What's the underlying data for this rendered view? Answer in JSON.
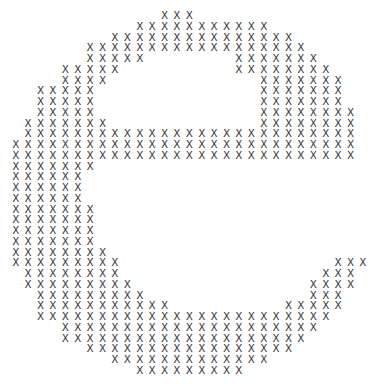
{
  "figure": {
    "glyph": "X",
    "glyph_color": "#3a3a3a",
    "background": "#ffffff",
    "grid": {
      "origin_x": 15.7,
      "origin_y": 15,
      "col_spacing": 12.4,
      "row_spacing": 10.75,
      "columns": 29,
      "rows": 34
    },
    "rows": [
      [
        [
          12,
          14
        ]
      ],
      [
        [
          10,
          20
        ]
      ],
      [
        [
          8,
          22
        ]
      ],
      [
        [
          6,
          23
        ]
      ],
      [
        [
          6,
          10
        ],
        [
          18,
          24
        ]
      ],
      [
        [
          4,
          8
        ],
        [
          18,
          25
        ]
      ],
      [
        [
          4,
          7
        ],
        [
          20,
          26
        ]
      ],
      [
        [
          2,
          6
        ],
        [
          20,
          26
        ]
      ],
      [
        [
          2,
          6
        ],
        [
          20,
          26
        ]
      ],
      [
        [
          2,
          6
        ],
        [
          20,
          27
        ]
      ],
      [
        [
          1,
          7
        ],
        [
          20,
          27
        ]
      ],
      [
        [
          1,
          27
        ]
      ],
      [
        [
          0,
          27
        ]
      ],
      [
        [
          0,
          27
        ]
      ],
      [
        [
          0,
          6
        ]
      ],
      [
        [
          0,
          5
        ]
      ],
      [
        [
          0,
          5
        ]
      ],
      [
        [
          0,
          5
        ]
      ],
      [
        [
          0,
          6
        ]
      ],
      [
        [
          0,
          6
        ]
      ],
      [
        [
          0,
          6
        ]
      ],
      [
        [
          0,
          6
        ]
      ],
      [
        [
          0,
          7
        ]
      ],
      [
        [
          0,
          8
        ],
        [
          26,
          28
        ]
      ],
      [
        [
          1,
          8
        ],
        [
          25,
          27
        ]
      ],
      [
        [
          1,
          9
        ],
        [
          24,
          27
        ]
      ],
      [
        [
          2,
          10
        ],
        [
          24,
          26
        ]
      ],
      [
        [
          2,
          12
        ],
        [
          22,
          26
        ]
      ],
      [
        [
          2,
          25
        ]
      ],
      [
        [
          4,
          24
        ]
      ],
      [
        [
          4,
          23
        ]
      ],
      [
        [
          6,
          22
        ]
      ],
      [
        [
          8,
          20
        ]
      ],
      [
        [
          10,
          18
        ]
      ]
    ]
  }
}
